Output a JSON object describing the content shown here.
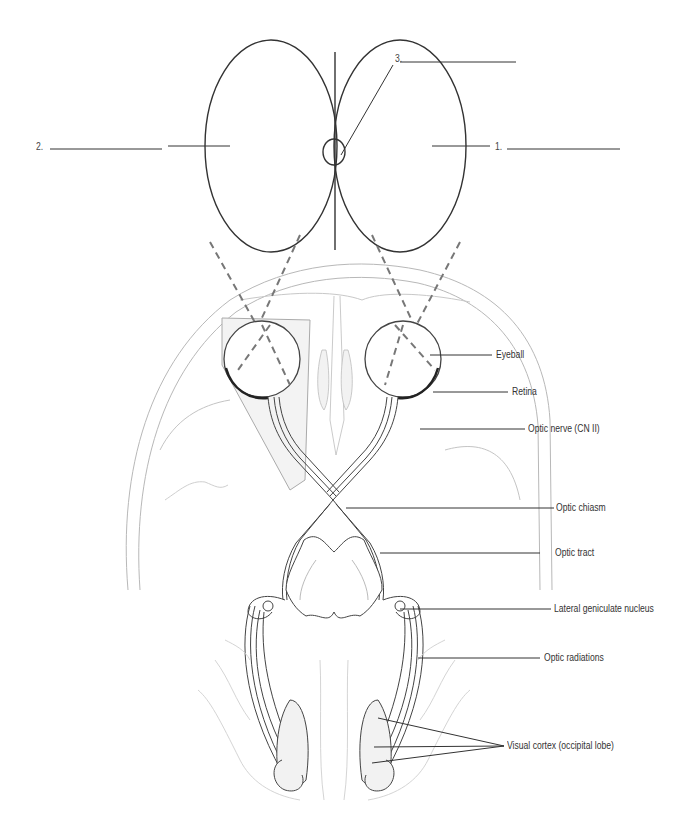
{
  "diagram": {
    "visual_field_blanks": [
      {
        "number": "1.",
        "answer": ""
      },
      {
        "number": "2.",
        "answer": ""
      },
      {
        "number": "3.",
        "answer": ""
      }
    ],
    "labels": {
      "eyeball": "Eyeball",
      "retina": "Retina",
      "optic_nerve": "Optic nerve (CN II)",
      "optic_chiasm": "Optic chiasm",
      "optic_tract": "Optic tract",
      "lgn": "Lateral geniculate nucleus",
      "optic_radiations": "Optic radiations",
      "visual_cortex": "Visual cortex (occipital lobe)"
    },
    "colors": {
      "line": "#333333",
      "dashed": "#777777",
      "anatomy_light": "#b8b8b8",
      "anatomy_fill": "#f4f4f4"
    }
  }
}
